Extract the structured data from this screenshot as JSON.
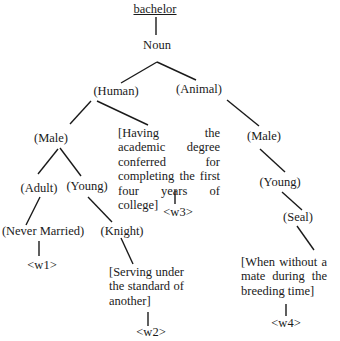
{
  "diagram": {
    "root": "bachelor",
    "pos": "Noun",
    "nodes": {
      "human": "(Human)",
      "animal": "(Animal)",
      "male_human": "(Male)",
      "male_animal": "(Male)",
      "adult": "(Adult)",
      "young_human": "(Young)",
      "young_animal": "(Young)",
      "never_married": "(Never Married)",
      "knight": "(Knight)",
      "seal": "(Seal)"
    },
    "glosses": {
      "academic": "[Having the academic degree conferred for completing the first four years of college]",
      "knight": "[Serving under the standard of another]",
      "seal": "[When without a mate during the breeding time]"
    },
    "senses": {
      "w1": "<w1>",
      "w2": "<w2>",
      "w3": "<w3>",
      "w4": "<w4>"
    }
  }
}
